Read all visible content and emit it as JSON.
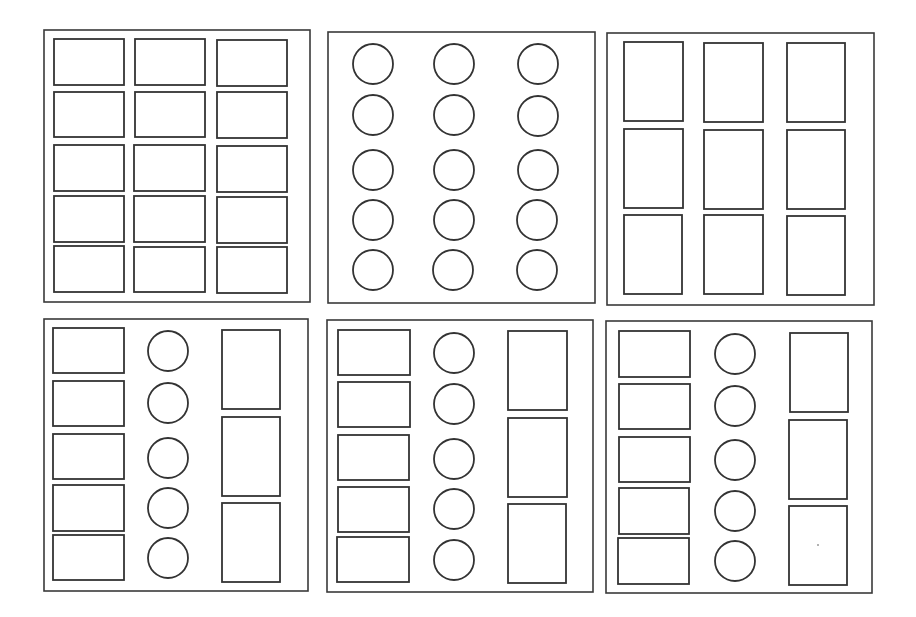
{
  "diagram": {
    "stroke_color": "#333333",
    "background": "#ffffff",
    "panels": [
      {
        "id": "panel-1",
        "frame": [
          44,
          30,
          266,
          272
        ],
        "shapes": [
          {
            "type": "rect",
            "x": 54,
            "y": 39,
            "w": 70,
            "h": 46
          },
          {
            "type": "rect",
            "x": 135,
            "y": 39,
            "w": 70,
            "h": 46
          },
          {
            "type": "rect",
            "x": 217,
            "y": 40,
            "w": 70,
            "h": 46
          },
          {
            "type": "rect",
            "x": 54,
            "y": 92,
            "w": 70,
            "h": 45
          },
          {
            "type": "rect",
            "x": 135,
            "y": 92,
            "w": 70,
            "h": 45
          },
          {
            "type": "rect",
            "x": 217,
            "y": 92,
            "w": 70,
            "h": 46
          },
          {
            "type": "rect",
            "x": 54,
            "y": 145,
            "w": 70,
            "h": 46
          },
          {
            "type": "rect",
            "x": 134,
            "y": 145,
            "w": 71,
            "h": 46
          },
          {
            "type": "rect",
            "x": 217,
            "y": 146,
            "w": 70,
            "h": 46
          },
          {
            "type": "rect",
            "x": 54,
            "y": 196,
            "w": 70,
            "h": 46
          },
          {
            "type": "rect",
            "x": 134,
            "y": 196,
            "w": 71,
            "h": 46
          },
          {
            "type": "rect",
            "x": 217,
            "y": 197,
            "w": 70,
            "h": 46
          },
          {
            "type": "rect",
            "x": 54,
            "y": 246,
            "w": 70,
            "h": 46
          },
          {
            "type": "rect",
            "x": 134,
            "y": 247,
            "w": 71,
            "h": 45
          },
          {
            "type": "rect",
            "x": 217,
            "y": 247,
            "w": 70,
            "h": 46
          }
        ]
      },
      {
        "id": "panel-2",
        "frame": [
          328,
          32,
          267,
          271
        ],
        "shapes": [
          {
            "type": "circle",
            "cx": 373,
            "cy": 64,
            "r": 20
          },
          {
            "type": "circle",
            "cx": 454,
            "cy": 64,
            "r": 20
          },
          {
            "type": "circle",
            "cx": 538,
            "cy": 64,
            "r": 20
          },
          {
            "type": "circle",
            "cx": 373,
            "cy": 115,
            "r": 20
          },
          {
            "type": "circle",
            "cx": 454,
            "cy": 115,
            "r": 20
          },
          {
            "type": "circle",
            "cx": 538,
            "cy": 116,
            "r": 20
          },
          {
            "type": "circle",
            "cx": 373,
            "cy": 170,
            "r": 20
          },
          {
            "type": "circle",
            "cx": 454,
            "cy": 170,
            "r": 20
          },
          {
            "type": "circle",
            "cx": 538,
            "cy": 170,
            "r": 20
          },
          {
            "type": "circle",
            "cx": 373,
            "cy": 220,
            "r": 20
          },
          {
            "type": "circle",
            "cx": 454,
            "cy": 220,
            "r": 20
          },
          {
            "type": "circle",
            "cx": 537,
            "cy": 220,
            "r": 20
          },
          {
            "type": "circle",
            "cx": 373,
            "cy": 270,
            "r": 20
          },
          {
            "type": "circle",
            "cx": 453,
            "cy": 270,
            "r": 20
          },
          {
            "type": "circle",
            "cx": 537,
            "cy": 270,
            "r": 20
          }
        ]
      },
      {
        "id": "panel-3",
        "frame": [
          607,
          33,
          267,
          272
        ],
        "shapes": [
          {
            "type": "rect",
            "x": 624,
            "y": 42,
            "w": 59,
            "h": 79
          },
          {
            "type": "rect",
            "x": 704,
            "y": 43,
            "w": 59,
            "h": 79
          },
          {
            "type": "rect",
            "x": 787,
            "y": 43,
            "w": 58,
            "h": 79
          },
          {
            "type": "rect",
            "x": 624,
            "y": 129,
            "w": 59,
            "h": 79
          },
          {
            "type": "rect",
            "x": 704,
            "y": 130,
            "w": 59,
            "h": 79
          },
          {
            "type": "rect",
            "x": 787,
            "y": 130,
            "w": 58,
            "h": 79
          },
          {
            "type": "rect",
            "x": 624,
            "y": 215,
            "w": 58,
            "h": 79
          },
          {
            "type": "rect",
            "x": 704,
            "y": 215,
            "w": 59,
            "h": 79
          },
          {
            "type": "rect",
            "x": 787,
            "y": 216,
            "w": 58,
            "h": 79
          }
        ]
      },
      {
        "id": "panel-4",
        "frame": [
          44,
          319,
          264,
          272
        ],
        "shapes": [
          {
            "type": "rect",
            "x": 53,
            "y": 328,
            "w": 71,
            "h": 45
          },
          {
            "type": "rect",
            "x": 53,
            "y": 381,
            "w": 71,
            "h": 45
          },
          {
            "type": "rect",
            "x": 53,
            "y": 434,
            "w": 71,
            "h": 45
          },
          {
            "type": "rect",
            "x": 53,
            "y": 485,
            "w": 71,
            "h": 46
          },
          {
            "type": "rect",
            "x": 53,
            "y": 535,
            "w": 71,
            "h": 45
          },
          {
            "type": "circle",
            "cx": 168,
            "cy": 351,
            "r": 20
          },
          {
            "type": "circle",
            "cx": 168,
            "cy": 403,
            "r": 20
          },
          {
            "type": "circle",
            "cx": 168,
            "cy": 458,
            "r": 20
          },
          {
            "type": "circle",
            "cx": 168,
            "cy": 508,
            "r": 20
          },
          {
            "type": "circle",
            "cx": 168,
            "cy": 558,
            "r": 20
          },
          {
            "type": "rect",
            "x": 222,
            "y": 330,
            "w": 58,
            "h": 79
          },
          {
            "type": "rect",
            "x": 222,
            "y": 417,
            "w": 58,
            "h": 79
          },
          {
            "type": "rect",
            "x": 222,
            "y": 503,
            "w": 58,
            "h": 79
          }
        ]
      },
      {
        "id": "panel-5",
        "frame": [
          327,
          320,
          266,
          272
        ],
        "shapes": [
          {
            "type": "rect",
            "x": 338,
            "y": 330,
            "w": 72,
            "h": 45
          },
          {
            "type": "rect",
            "x": 338,
            "y": 382,
            "w": 72,
            "h": 45
          },
          {
            "type": "rect",
            "x": 338,
            "y": 435,
            "w": 71,
            "h": 45
          },
          {
            "type": "rect",
            "x": 338,
            "y": 487,
            "w": 71,
            "h": 45
          },
          {
            "type": "rect",
            "x": 337,
            "y": 537,
            "w": 72,
            "h": 45
          },
          {
            "type": "circle",
            "cx": 454,
            "cy": 353,
            "r": 20
          },
          {
            "type": "circle",
            "cx": 454,
            "cy": 404,
            "r": 20
          },
          {
            "type": "circle",
            "cx": 454,
            "cy": 459,
            "r": 20
          },
          {
            "type": "circle",
            "cx": 454,
            "cy": 509,
            "r": 20
          },
          {
            "type": "circle",
            "cx": 454,
            "cy": 560,
            "r": 20
          },
          {
            "type": "rect",
            "x": 508,
            "y": 331,
            "w": 59,
            "h": 79
          },
          {
            "type": "rect",
            "x": 508,
            "y": 418,
            "w": 59,
            "h": 79
          },
          {
            "type": "rect",
            "x": 508,
            "y": 504,
            "w": 58,
            "h": 79
          }
        ]
      },
      {
        "id": "panel-6",
        "frame": [
          606,
          321,
          266,
          272
        ],
        "shapes": [
          {
            "type": "rect",
            "x": 619,
            "y": 331,
            "w": 71,
            "h": 46
          },
          {
            "type": "rect",
            "x": 619,
            "y": 384,
            "w": 71,
            "h": 45
          },
          {
            "type": "rect",
            "x": 619,
            "y": 437,
            "w": 71,
            "h": 45
          },
          {
            "type": "rect",
            "x": 619,
            "y": 488,
            "w": 70,
            "h": 46
          },
          {
            "type": "rect",
            "x": 618,
            "y": 538,
            "w": 71,
            "h": 46
          },
          {
            "type": "circle",
            "cx": 735,
            "cy": 354,
            "r": 20
          },
          {
            "type": "circle",
            "cx": 735,
            "cy": 406,
            "r": 20
          },
          {
            "type": "circle",
            "cx": 735,
            "cy": 460,
            "r": 20
          },
          {
            "type": "circle",
            "cx": 735,
            "cy": 511,
            "r": 20
          },
          {
            "type": "circle",
            "cx": 735,
            "cy": 561,
            "r": 20
          },
          {
            "type": "rect",
            "x": 790,
            "y": 333,
            "w": 58,
            "h": 79
          },
          {
            "type": "rect",
            "x": 789,
            "y": 420,
            "w": 58,
            "h": 79
          },
          {
            "type": "rect",
            "x": 789,
            "y": 506,
            "w": 58,
            "h": 79
          }
        ],
        "marks": [
          {
            "type": "dot",
            "cx": 818,
            "cy": 545,
            "r": 1
          }
        ]
      }
    ]
  }
}
